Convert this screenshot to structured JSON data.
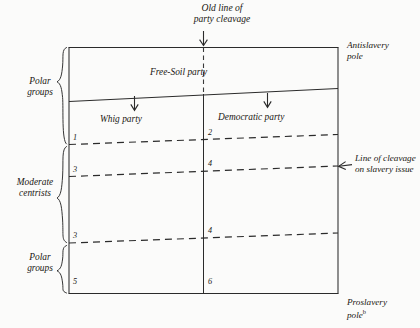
{
  "diagram": {
    "title_lines": [
      "Old line of",
      "party cleavage"
    ],
    "poles": {
      "top_label_lines": [
        "Antislavery",
        "pole"
      ],
      "top_label": "Antislavery pole",
      "bottom_label_lines": [
        "Proslavery",
        "pole"
      ],
      "bottom_label": "Proslavery pole",
      "bottom_label_superscript": "b"
    },
    "right_annotation": {
      "lines": [
        "Line of cleavage",
        "on slavery issue"
      ],
      "text": "Line of cleavage on slavery issue"
    },
    "parties": [
      {
        "name": "Free-Soil party",
        "position": "top-band"
      },
      {
        "name": "Whig party",
        "position": "left-column"
      },
      {
        "name": "Democratic party",
        "position": "right-column"
      }
    ],
    "left_brackets": [
      {
        "label_lines": [
          "Polar",
          "groups"
        ],
        "label": "Polar groups",
        "span": "top"
      },
      {
        "label_lines": [
          "Moderate",
          "centrists"
        ],
        "label": "Moderate centrists",
        "span": "middle"
      },
      {
        "label_lines": [
          "Polar",
          "groups"
        ],
        "label": "Polar groups",
        "span": "bottom"
      }
    ],
    "cell_numbers": {
      "left_column": [
        "1",
        "3",
        "3",
        "5"
      ],
      "right_column": [
        "2",
        "4",
        "4",
        "6"
      ]
    },
    "arrows": [
      {
        "name": "old-line-of-party-cleavage-arrow",
        "direction": "down"
      },
      {
        "name": "whig-party-arrow",
        "direction": "down"
      },
      {
        "name": "democratic-party-arrow",
        "direction": "down"
      },
      {
        "name": "line-of-cleavage-arrow",
        "direction": "left"
      }
    ],
    "colors": {
      "ink": "#1a1712",
      "paper": "#fbfbfa",
      "rule": "#2b2b2b"
    }
  }
}
